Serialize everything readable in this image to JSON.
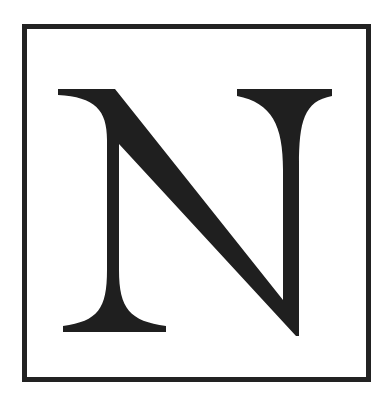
{
  "figure": {
    "letter": "N",
    "frame_color": "#222222",
    "glyph_color": "#1f1f1f",
    "background_color": "#ffffff"
  }
}
